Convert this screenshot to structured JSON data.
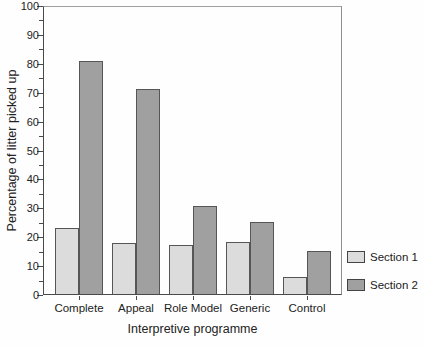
{
  "figure": {
    "background": "#fefefe",
    "axis_color": "#4a4a4a",
    "frame_color": "#9a9a9a"
  },
  "chart_data": {
    "type": "bar",
    "title": "",
    "categories": [
      "Complete",
      "Appeal",
      "Role Model",
      "Generic",
      "Control"
    ],
    "series": [
      {
        "name": "Section 1",
        "color": "#dcdcdc",
        "values": [
          23,
          17.5,
          17,
          18,
          6
        ]
      },
      {
        "name": "Section 2",
        "color": "#a0a0a0",
        "values": [
          80.5,
          71,
          30.5,
          25,
          15
        ]
      }
    ],
    "xlabel": "Interpretive programme",
    "ylabel": "Percentage of litter picked up",
    "ylim": [
      0,
      100
    ],
    "y_ticks": [
      0,
      10,
      20,
      30,
      40,
      50,
      60,
      70,
      80,
      90,
      100
    ],
    "y_minor_step": 5,
    "grid": "off",
    "legend_position": "right-bottom",
    "bar_border_color": "#565656"
  }
}
